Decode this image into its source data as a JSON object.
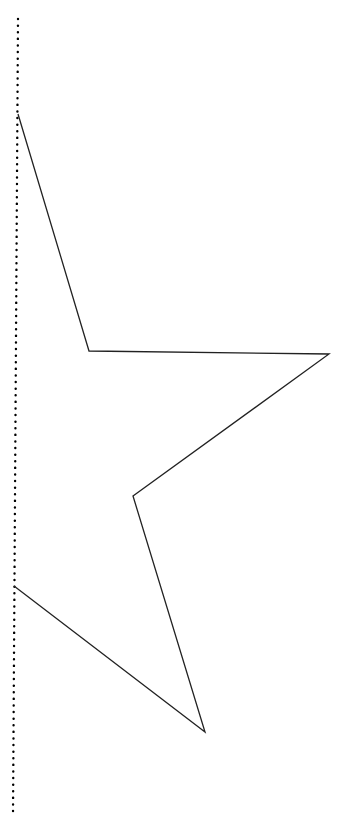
{
  "canvas": {
    "width": 354,
    "height": 816,
    "background": "#ffffff"
  },
  "guide_line": {
    "style": "dotted",
    "color": "#000000",
    "x1": 18,
    "y1": 19,
    "x2": 13,
    "y2": 816,
    "dot_spacing": 6.5,
    "dot_radius": 1.2
  },
  "star_shape": {
    "stroke": "#222222",
    "stroke_width": 1.3,
    "points": [
      [
        18,
        114
      ],
      [
        89,
        351
      ],
      [
        329,
        354
      ],
      [
        133,
        496
      ],
      [
        205,
        732
      ],
      [
        14,
        586
      ]
    ]
  }
}
